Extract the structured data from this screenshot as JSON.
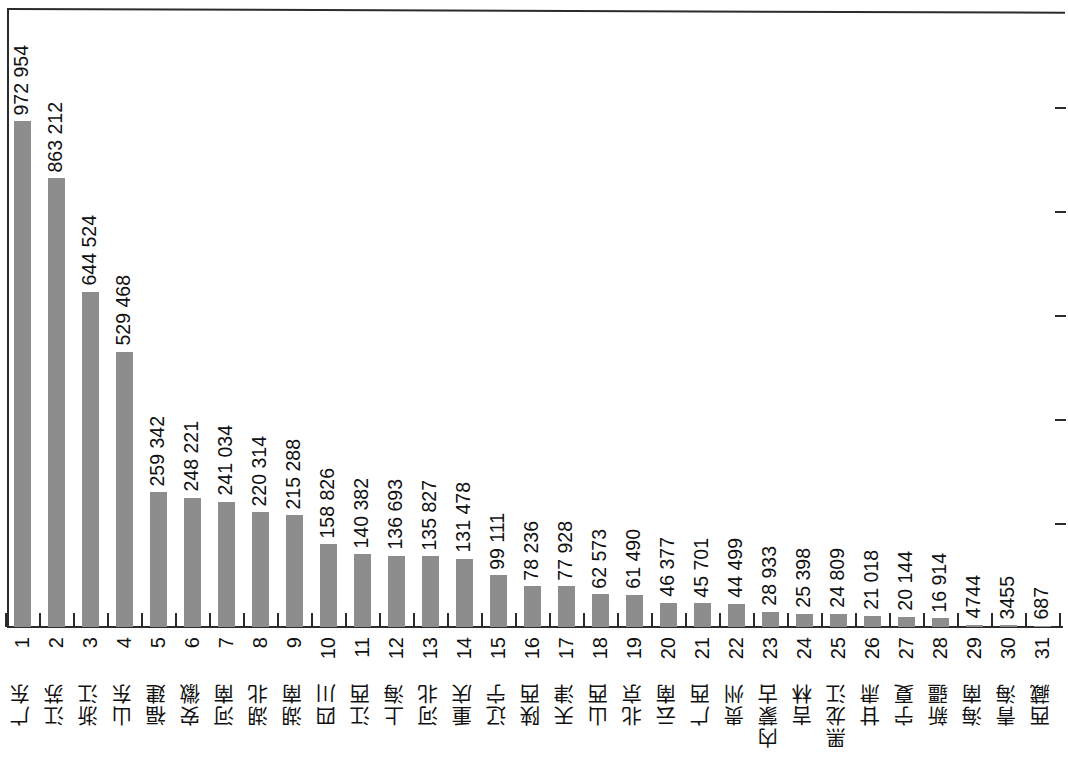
{
  "chart_data": {
    "type": "bar",
    "title": "",
    "subtitle": "",
    "xlabel": "",
    "ylabel": "",
    "orientation": "vertical",
    "grid": false,
    "legend": null,
    "legend_position": "none",
    "bar_color": "#8d8d8d",
    "axis_color": "#2b2b2b",
    "value_label_color": "#111111",
    "ylim": [
      0,
      1100000
    ],
    "y_tick_values": [
      200000,
      400000,
      600000,
      800000,
      1000000
    ],
    "y_tick_labels_visible": false,
    "value_thousands_separator": "space",
    "ranks": [
      "1",
      "2",
      "3",
      "4",
      "5",
      "6",
      "7",
      "8",
      "9",
      "10",
      "11",
      "12",
      "13",
      "14",
      "15",
      "16",
      "17",
      "18",
      "19",
      "20",
      "21",
      "22",
      "23",
      "24",
      "25",
      "26",
      "27",
      "28",
      "29",
      "30",
      "31"
    ],
    "categories": [
      "广东",
      "江苏",
      "浙江",
      "山东",
      "福建",
      "安徽",
      "河南",
      "湖北",
      "湖南",
      "四川",
      "江西",
      "上海",
      "河北",
      "重庆",
      "辽宁",
      "陕西",
      "天津",
      "山西",
      "北京",
      "云南",
      "广西",
      "贵州",
      "内蒙古",
      "吉林",
      "黑龙江",
      "甘肃",
      "宁夏",
      "新疆",
      "海南",
      "青海",
      "西藏"
    ],
    "values": [
      972954,
      863212,
      644524,
      529468,
      259342,
      248221,
      241034,
      220314,
      215288,
      158826,
      140382,
      136693,
      135827,
      131478,
      99111,
      78236,
      77928,
      62573,
      61490,
      46377,
      45701,
      44499,
      28933,
      25398,
      24809,
      21018,
      20144,
      16914,
      4744,
      3455,
      687
    ],
    "value_labels": [
      "972 954",
      "863 212",
      "644 524",
      "529 468",
      "259 342",
      "248 221",
      "241 034",
      "220 314",
      "215 288",
      "158 826",
      "140 382",
      "136 693",
      "135 827",
      "131 478",
      "99 111",
      "78 236",
      "77 928",
      "62 573",
      "61 490",
      "46 377",
      "45 701",
      "44 499",
      "28 933",
      "25 398",
      "24 809",
      "21 018",
      "20 144",
      "16 914",
      "4744",
      "3455",
      "687"
    ]
  }
}
